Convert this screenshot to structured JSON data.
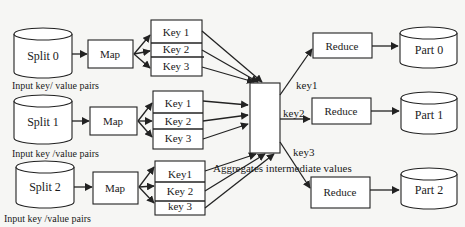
{
  "diagram": {
    "title_fragment": "",
    "rows": [
      {
        "split_label": "Split 0",
        "map_label": "Map",
        "keys": [
          "Key 1",
          "Key 2",
          "Key 3"
        ],
        "input_label": "Input key/ value pairs"
      },
      {
        "split_label": "Split 1",
        "map_label": "Map",
        "keys": [
          "Key 1",
          "Key 2",
          "Key 3"
        ],
        "input_label": "Input key /value pairs"
      },
      {
        "split_label": "Split 2",
        "map_label": "Map",
        "keys": [
          "Key1",
          "Key 2",
          "key 3"
        ],
        "input_label": "Input key /value pairs"
      }
    ],
    "top_input_label": "Input key/ value pairs",
    "aggregate_label": "Aggregates intermediate values",
    "edge_labels": [
      "key1",
      "key2",
      "key3"
    ],
    "reducers": [
      {
        "label": "Reduce",
        "output": "Part 0"
      },
      {
        "label": "Reduce",
        "output": "Part 1"
      },
      {
        "label": "Reduce",
        "output": "Part 2"
      }
    ]
  }
}
